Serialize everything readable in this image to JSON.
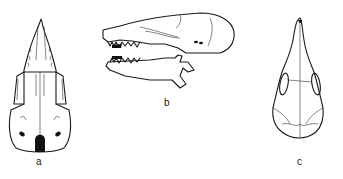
{
  "figure": {
    "panels": [
      {
        "id": "a",
        "label": "a",
        "view": "skull-ventral-view"
      },
      {
        "id": "b",
        "label": "b",
        "view": "skull-lateral-view"
      },
      {
        "id": "c",
        "label": "c",
        "view": "skull-dorsal-view"
      }
    ]
  }
}
